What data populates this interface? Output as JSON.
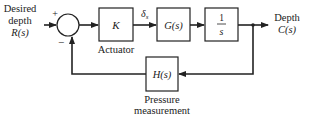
{
  "diagram": {
    "type": "feedback-control-block-diagram",
    "input": {
      "line1": "Desired",
      "line2": "depth",
      "line3": "R(s)"
    },
    "output": {
      "line1": "Depth",
      "line2": "C(s)"
    },
    "summing_junction": {
      "plus_sign": "+",
      "minus_sign": "−"
    },
    "blocks": [
      {
        "id": "actuator",
        "label": "K",
        "caption": "Actuator"
      },
      {
        "id": "plant",
        "label": "G(s)"
      },
      {
        "id": "integrator",
        "numerator": "1",
        "denominator": "s"
      },
      {
        "id": "sensor",
        "label": "H(s)",
        "caption_line1": "Pressure",
        "caption_line2": "measurement"
      }
    ],
    "signals": {
      "actuator_output": "δ",
      "actuator_output_sub": "s"
    }
  }
}
